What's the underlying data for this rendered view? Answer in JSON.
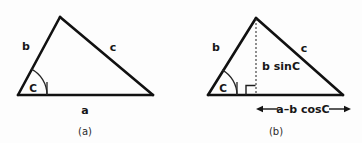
{
  "figure": {
    "background_color": "#fdfdfd",
    "line_color": "#111111",
    "text_color": "#171717"
  },
  "panel_a": {
    "caption": "(a)",
    "labels": {
      "side_b": "b",
      "side_c": "c",
      "side_a": "a",
      "angle_c": "C"
    },
    "geometry": {
      "left_vertex": [
        18,
        95
      ],
      "apex": [
        60,
        17
      ],
      "right_vertex": [
        153,
        95
      ]
    }
  },
  "panel_b": {
    "caption": "(b)",
    "labels": {
      "side_b": "b",
      "side_c": "c",
      "angle_c": "C",
      "height": "b sinC",
      "base_segment": "a–b cosC"
    },
    "geometry": {
      "left_vertex": [
        208,
        95
      ],
      "apex": [
        256,
        18
      ],
      "right_vertex": [
        343,
        95
      ],
      "foot": [
        256,
        95
      ]
    }
  },
  "icons": {
    "angle_arc": "angle-arc-icon",
    "right_angle": "right-angle-marker-icon",
    "arrow_left": "arrow-left-icon",
    "arrow_right": "arrow-right-icon",
    "dashed_altitude": "dashed-line-icon"
  }
}
